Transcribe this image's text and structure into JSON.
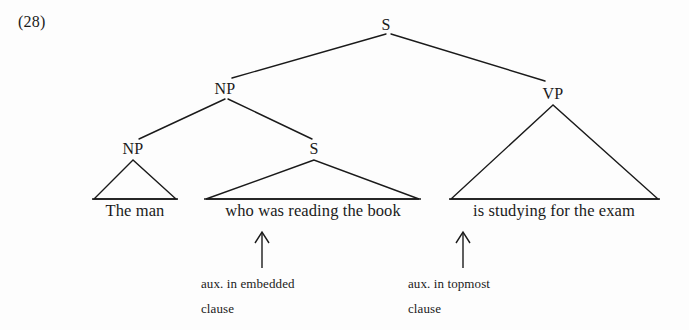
{
  "figure": {
    "example_number": "(28)",
    "type": "syntax-tree",
    "ink_color": "#1a1a1a",
    "background_color": "#fdfdfd"
  },
  "tree": {
    "nodes": [
      {
        "id": "s-root",
        "label": "S",
        "x": 386,
        "y": 26,
        "level": 0
      },
      {
        "id": "np-top",
        "label": "NP",
        "x": 225,
        "y": 90,
        "level": 1
      },
      {
        "id": "vp",
        "label": "VP",
        "x": 553,
        "y": 95,
        "level": 1
      },
      {
        "id": "np-inner",
        "label": "NP",
        "x": 133,
        "y": 150,
        "level": 2
      },
      {
        "id": "s-inner",
        "label": "S",
        "x": 314,
        "y": 150,
        "level": 2
      }
    ],
    "edges": [
      {
        "from": "s-root",
        "to": "np-top"
      },
      {
        "from": "s-root",
        "to": "vp"
      },
      {
        "from": "np-top",
        "to": "np-inner"
      },
      {
        "from": "np-top",
        "to": "s-inner"
      }
    ],
    "triangles": [
      {
        "id": "tri-the-man",
        "apex_x": 133,
        "apex_y": 160,
        "left_x": 94,
        "right_x": 176,
        "base_y": 200,
        "terminal": "The man"
      },
      {
        "id": "tri-relative",
        "apex_x": 314,
        "apex_y": 160,
        "left_x": 206,
        "right_x": 419,
        "base_y": 200,
        "terminal": "who was reading the book"
      },
      {
        "id": "tri-vp",
        "apex_x": 553,
        "apex_y": 105,
        "left_x": 451,
        "right_x": 658,
        "base_y": 200,
        "terminal": "is studying for the exam"
      }
    ],
    "terminals": [
      {
        "id": "terminal-the-man",
        "text": "The man",
        "center_x": 135,
        "y": 207
      },
      {
        "id": "terminal-relative",
        "text": "who was reading the book",
        "center_x": 313,
        "y": 207
      },
      {
        "id": "terminal-vp",
        "text": "is studying for the exam",
        "center_x": 554,
        "y": 207
      }
    ]
  },
  "annotations": [
    {
      "id": "annotation-embedded",
      "arrow": {
        "x": 262,
        "y_top": 233,
        "y_bottom": 268
      },
      "lines": [
        "aux. in embedded",
        "clause"
      ],
      "text_x": 201,
      "line1_y": 277,
      "line2_y": 302
    },
    {
      "id": "annotation-topmost",
      "arrow": {
        "x": 463,
        "y_top": 233,
        "y_bottom": 268
      },
      "lines": [
        "aux. in topmost",
        "clause"
      ],
      "text_x": 408,
      "line1_y": 277,
      "line2_y": 302
    }
  ]
}
